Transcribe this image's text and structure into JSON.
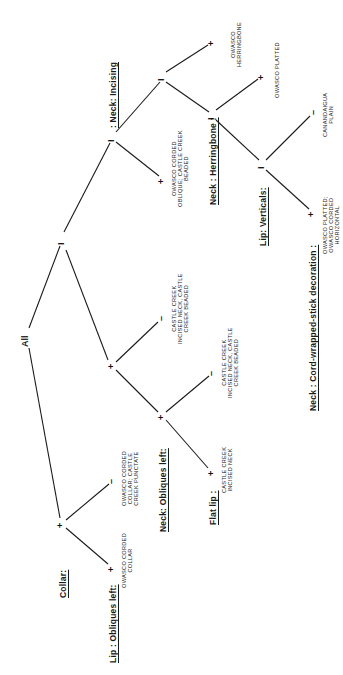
{
  "diagram": {
    "type": "classification-tree",
    "orientation": "rotated-90-counterclockwise",
    "root": "All",
    "headings": {
      "neck_incising": ": Neck: Incising",
      "neck_herringbone": "Neck : Herringbone :",
      "lip_verticals": "Lip: Verticals:",
      "neck_cord_wrapped": "Neck : Cord-wrapped-stick decoration :",
      "collar": "Collar:",
      "lip_obliques_left": "Lip : Obliques left:",
      "neck_obliques_left": "Neck: Obliques left:",
      "flat_lip": "Flat lip :"
    },
    "node_symbols": {
      "split": "I",
      "present": "+",
      "absent": "–"
    },
    "leaves": {
      "owasco_herringbone": [
        "OWASCO",
        "HERRINGBONE"
      ],
      "owasco_platted": [
        "OWASCO  PLATTED"
      ],
      "canandaigua_plain": [
        "CANANDAIGUA",
        "PLAIN"
      ],
      "owasco_platted_corded_horizontal": [
        "OWASCO  PLATTED;",
        "OWASCO  CORDED",
        "HORIZONTAL"
      ],
      "owasco_corded_oblique": [
        "OWASCO  CORDED",
        "OBLIQUE; CASTLE CREEK",
        "BEADED"
      ],
      "castle_creek_incised_neck_beaded_1": [
        "CASTLE  CREEK",
        "INCISED NECK, CASTLE",
        "CREEK  BEADED"
      ],
      "castle_creek_incised_neck_beaded_2": [
        "CASTLE  CREEK",
        "INCISED  NECK, CASTLE",
        "CREEK  BEADED"
      ],
      "castle_creek_incised_neck": [
        "CASTLE  CREEK",
        "INCISED  NECK"
      ],
      "owasco_corded_collar_punctate": [
        "OWASCO  CORDED",
        "COLLAR; CASTLE",
        "CREEK  PUNCTATE"
      ],
      "owasco_corded_collar": [
        "OWASCO  CORDED",
        "COLLAR"
      ]
    },
    "tree": {
      "label": "All",
      "children": [
        {
          "symbol": "I",
          "heading": "Neck: Incising",
          "children": [
            {
              "symbol": "I",
              "children": [
                {
                  "symbol": "+",
                  "leaf": "OWASCO HERRINGBONE"
                },
                {
                  "symbol": "I",
                  "heading": "Neck : Herringbone",
                  "children": [
                    {
                      "symbol": "+",
                      "leaf": "OWASCO PLATTED"
                    },
                    {
                      "symbol": "I",
                      "heading": "Lip: Verticals",
                      "children": [
                        {
                          "symbol": "–",
                          "leaf": "CANANDAIGUA PLAIN"
                        },
                        {
                          "symbol": "+",
                          "heading": "Neck : Cord-wrapped-stick decoration",
                          "leaf": "OWASCO PLATTED; OWASCO CORDED HORIZONTAL"
                        }
                      ]
                    }
                  ]
                }
              ]
            },
            {
              "symbol": "+",
              "leaf": "OWASCO CORDED OBLIQUE; CASTLE CREEK BEADED"
            }
          ]
        },
        {
          "symbol": "+",
          "children": [
            {
              "symbol": "–",
              "leaf": "CASTLE CREEK INCISED NECK, CASTLE CREEK BEADED"
            },
            {
              "symbol": "+",
              "heading": "Neck: Obliques left",
              "children": [
                {
                  "symbol": "–",
                  "leaf": "CASTLE CREEK INCISED NECK, CASTLE CREEK BEADED"
                },
                {
                  "symbol": "+",
                  "heading": "Flat lip",
                  "leaf": "CASTLE CREEK INCISED NECK"
                }
              ]
            }
          ]
        },
        {
          "symbol": "+",
          "heading": "Collar",
          "children": [
            {
              "symbol": "–",
              "leaf": "OWASCO CORDED COLLAR; CASTLE CREEK PUNCTATE"
            },
            {
              "symbol": "+",
              "heading": "Lip : Obliques left",
              "leaf": "OWASCO CORDED COLLAR"
            }
          ]
        }
      ]
    }
  }
}
